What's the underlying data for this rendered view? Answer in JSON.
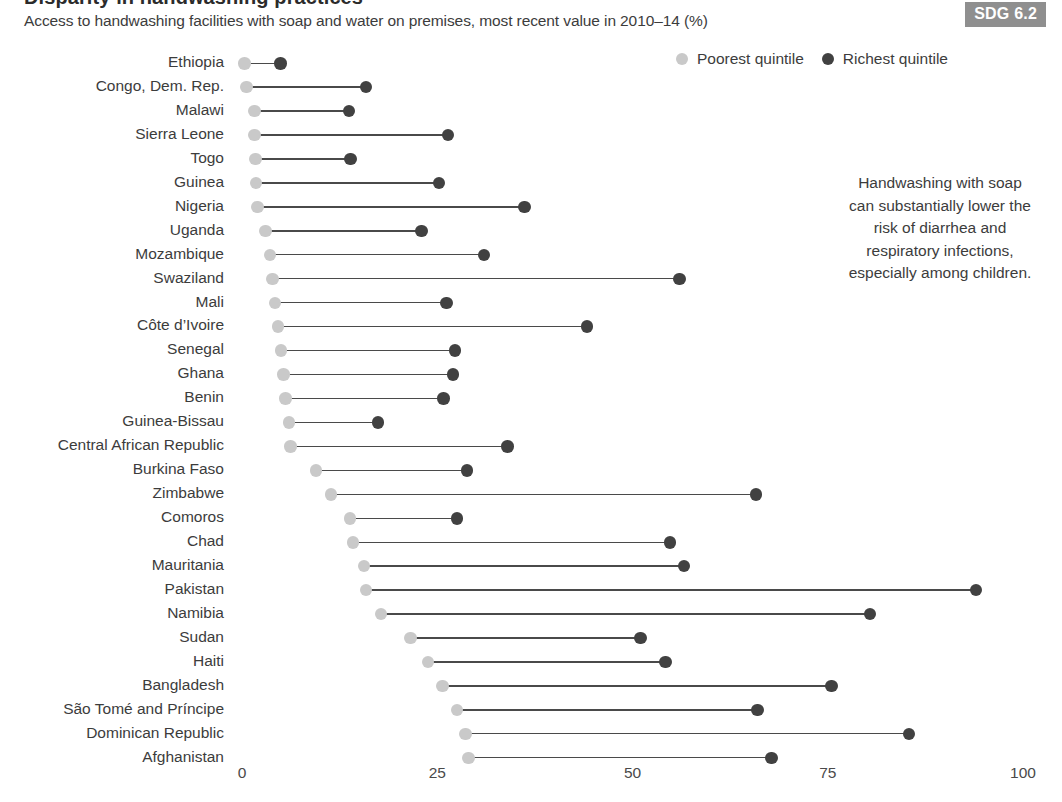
{
  "header": {
    "title_clipped": "Disparity in handwashing practices",
    "subtitle": "Access to handwashing facilities with soap and water on premises, most recent value in 2010–14 (%)",
    "badge": "SDG 6.2"
  },
  "legend": {
    "items": [
      {
        "label": "Poorest quintile",
        "color": "#c9c9c9",
        "icon": "circle-icon"
      },
      {
        "label": "Richest quintile",
        "color": "#414141",
        "icon": "circle-icon"
      }
    ]
  },
  "annotation": {
    "text": "Handwashing with soap can substantially lower the risk of diarrhea and respiratory infections, especially among children."
  },
  "axis": {
    "ticks": [
      "0",
      "25",
      "50",
      "75",
      "100"
    ]
  },
  "chart_data": {
    "type": "dumbbell",
    "title": "Disparity in handwashing practices",
    "subtitle": "Access to handwashing facilities with soap and water on premises, most recent value in 2010–14 (%)",
    "xlabel": "",
    "ylabel": "",
    "xlim": [
      0,
      100
    ],
    "xticks": [
      0,
      25,
      50,
      75,
      100
    ],
    "grid": false,
    "legend_position": "top-right",
    "series": [
      {
        "name": "Poorest quintile",
        "color": "#c9c9c9"
      },
      {
        "name": "Richest quintile",
        "color": "#414141"
      }
    ],
    "categories": [
      "Ethiopia",
      "Congo, Dem. Rep.",
      "Malawi",
      "Sierra Leone",
      "Togo",
      "Guinea",
      "Nigeria",
      "Uganda",
      "Mozambique",
      "Swaziland",
      "Mali",
      "Côte d’Ivoire",
      "Senegal",
      "Ghana",
      "Benin",
      "Guinea-Bissau",
      "Central African Republic",
      "Burkina Faso",
      "Zimbabwe",
      "Comoros",
      "Chad",
      "Mauritania",
      "Pakistan",
      "Namibia",
      "Sudan",
      "Haiti",
      "Bangladesh",
      "São Tomé and Príncipe",
      "Dominican Republic",
      "Afghanistan"
    ],
    "poorest": [
      0.3,
      0.6,
      1.6,
      1.6,
      1.7,
      1.8,
      2.0,
      3.0,
      3.6,
      3.9,
      4.2,
      4.6,
      5.0,
      5.3,
      5.6,
      6.0,
      6.2,
      9.5,
      11.4,
      13.8,
      14.2,
      15.6,
      15.9,
      17.8,
      21.6,
      23.8,
      25.7,
      27.5,
      28.6,
      29.0
    ],
    "richest": [
      4.9,
      15.9,
      13.7,
      26.4,
      13.9,
      25.2,
      36.2,
      23.0,
      31.0,
      56.0,
      26.2,
      44.2,
      27.3,
      27.0,
      25.8,
      17.4,
      34.0,
      28.8,
      65.8,
      27.5,
      54.8,
      56.6,
      94.0,
      80.4,
      51.0,
      54.2,
      75.5,
      66.0,
      85.4,
      67.8
    ]
  }
}
